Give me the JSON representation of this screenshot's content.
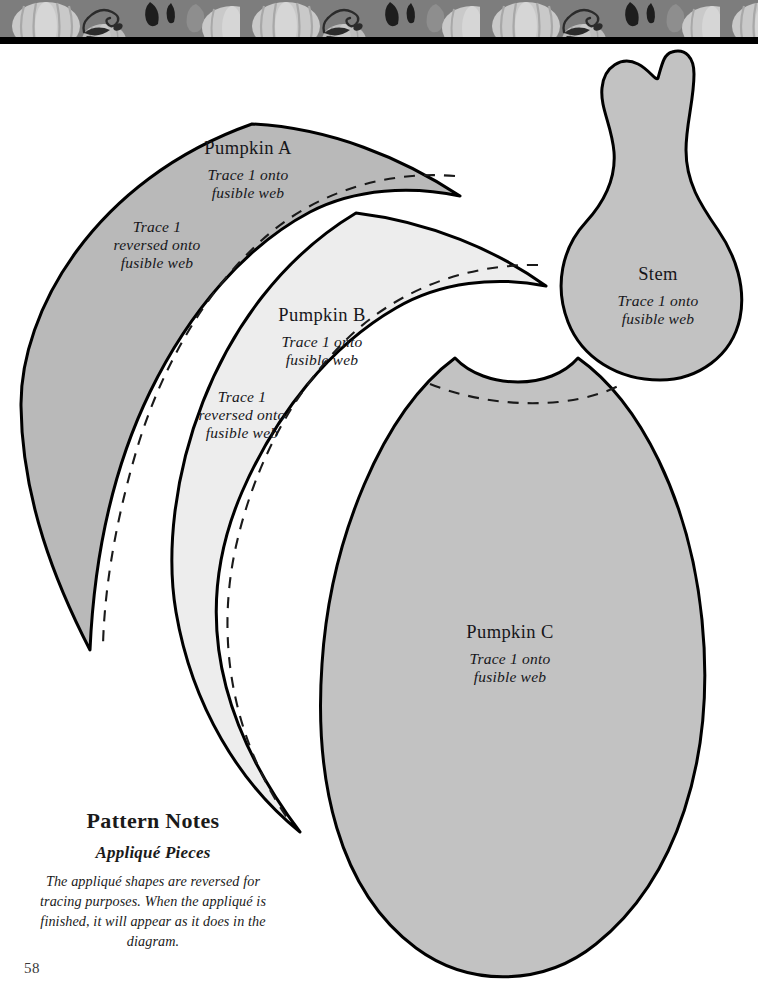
{
  "page": {
    "number": "58",
    "background_color": "#ffffff"
  },
  "header_band": {
    "name": "pumpkin-vine-decorative-border",
    "background_color": "#7d7d7d",
    "pumpkin_color": "#c9c9c9",
    "pumpkin_shade_color": "#a8a8a8",
    "vine_color": "#2b2b2b",
    "rule_color": "#000000",
    "height_px": 44
  },
  "pieces": [
    {
      "id": "pumpkin-a",
      "name": "Pumpkin A",
      "fill_color": "#b9b9b9",
      "outline_color": "#000000",
      "note": "Trace 1 onto\nfusible web",
      "note_secondary": "Trace 1\nreversed onto\nfusible web",
      "has_dashed_guide": true
    },
    {
      "id": "pumpkin-b",
      "name": "Pumpkin B",
      "fill_color": "#ededed",
      "outline_color": "#000000",
      "note": "Trace 1 onto\nfusible web",
      "note_secondary": "Trace 1\nreversed onto\nfusible web",
      "has_dashed_guide": true
    },
    {
      "id": "pumpkin-c",
      "name": "Pumpkin C",
      "fill_color": "#c2c2c2",
      "outline_color": "#000000",
      "note": "Trace 1 onto\nfusible web",
      "note_secondary": "",
      "has_dashed_guide": true
    },
    {
      "id": "stem",
      "name": "Stem",
      "fill_color": "#c2c2c2",
      "outline_color": "#000000",
      "note": "Trace 1 onto\nfusible web",
      "note_secondary": "",
      "has_dashed_guide": false
    }
  ],
  "pattern_notes": {
    "title": "Pattern Notes",
    "subtitle": "Appliqué Pieces",
    "body": "The appliqué shapes are reversed for tracing purposes. When the appliqué is finished, it will appear as it does in the diagram."
  }
}
